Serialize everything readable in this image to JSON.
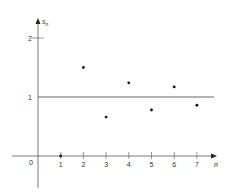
{
  "chart_data": {
    "type": "scatter",
    "title": "",
    "xlabel": "n",
    "ylabel": "s_n",
    "x": [
      1,
      2,
      3,
      4,
      5,
      6,
      7
    ],
    "series": [
      {
        "name": "s_n",
        "values": [
          0,
          1.5,
          0.66,
          1.24,
          0.78,
          1.17,
          0.86
        ]
      }
    ],
    "reference_line": {
      "y": 1
    },
    "x_ticks": [
      "1",
      "2",
      "3",
      "4",
      "5",
      "6",
      "7"
    ],
    "y_ticks": [
      "1",
      "2"
    ],
    "origin_label": "0",
    "xlim": [
      -0.9,
      7.4
    ],
    "ylim": [
      -0.55,
      2.3
    ],
    "grid": false,
    "legend": "none"
  },
  "axis": {
    "x_label": "n",
    "y_label_base": "s",
    "y_label_sub": "n",
    "origin": "0"
  },
  "colors": {
    "axis": "#555555",
    "line": "#666666",
    "point": "#111111"
  }
}
